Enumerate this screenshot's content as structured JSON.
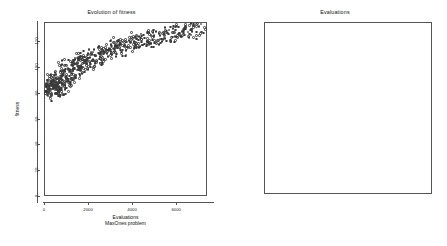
{
  "figure": {
    "background": "#ffffff",
    "panels": [
      "fitness-evolution",
      "evaluations-boxplot"
    ]
  },
  "left_panel": {
    "title": "Evolution of fitness",
    "xlabel_line1": "Evaluations",
    "xlabel_line2": "MaxOnes problem",
    "ylabel": "fitness"
  },
  "right_panel": {
    "title": "Evaluations",
    "xlabel_line1": "Population",
    "xlabel_line2": "MaxOnes",
    "ylabel": "evaluations"
  },
  "chart_data": [
    {
      "type": "scatter",
      "id": "fitness-evolution",
      "title": "Evolution of fitness",
      "xlabel": "Evaluations\nMaxOnes problem",
      "ylabel": "fitness",
      "xlim": [
        0,
        7400
      ],
      "ylim": [
        0,
        135
      ],
      "xticks": [
        0,
        2000,
        4000,
        6000
      ],
      "xticklabels": [
        "0",
        "2000",
        "4000",
        "6000"
      ],
      "yticks": [
        0,
        20,
        40,
        60,
        80,
        100,
        120
      ],
      "yticklabels": [
        "0",
        "20",
        "40",
        "60",
        "80",
        "100",
        "120"
      ],
      "grid": false,
      "legend": null,
      "marker": "open-circle",
      "marker_color": "#3a3a3a",
      "x": [
        320,
        340,
        360,
        380,
        400,
        420,
        440,
        460,
        480,
        500,
        520,
        540,
        560,
        580,
        600,
        620,
        640,
        660,
        680,
        700,
        720,
        740,
        760,
        790,
        820,
        850,
        880,
        910,
        940,
        970,
        1000,
        1040,
        1080,
        1120,
        1160,
        1200,
        1240,
        1280,
        1320,
        1360,
        1400,
        1450,
        1500,
        1550,
        1600,
        1650,
        1700,
        1760,
        1820,
        1880,
        1940,
        2000,
        2070,
        2140,
        2210,
        2280,
        2350,
        2420,
        2500,
        2580,
        2660,
        2740,
        2820,
        2900,
        2990,
        3080,
        3170,
        3260,
        3350,
        3440,
        3530,
        3630,
        3730,
        3830,
        3930,
        4030,
        4130,
        4240,
        4350,
        4460,
        4570,
        4680,
        4800,
        4920,
        5040,
        5160,
        5280,
        5400,
        5530,
        5660,
        5790,
        5920,
        6050,
        6180,
        6320,
        6460,
        6600,
        6740,
        6880,
        7020,
        7160,
        7280
      ],
      "y": [
        78,
        76,
        79,
        80,
        80,
        81,
        79,
        80,
        81,
        82,
        80,
        81,
        82,
        81,
        82,
        83,
        82,
        83,
        84,
        83,
        84,
        85,
        84,
        85,
        86,
        85,
        87,
        86,
        88,
        87,
        89,
        88,
        90,
        91,
        90,
        92,
        93,
        92,
        94,
        95,
        96,
        95,
        97,
        98,
        97,
        99,
        100,
        99,
        100,
        101,
        102,
        101,
        103,
        102,
        104,
        105,
        104,
        106,
        105,
        107,
        108,
        107,
        109,
        110,
        109,
        111,
        112,
        111,
        113,
        112,
        114,
        113,
        115,
        114,
        116,
        115,
        117,
        116,
        118,
        117,
        119,
        118,
        120,
        119,
        121,
        120,
        122,
        121,
        123,
        122,
        124,
        123,
        125,
        124,
        125,
        126,
        125,
        127,
        126,
        127,
        128,
        127,
        128,
        128
      ]
    },
    {
      "type": "box",
      "id": "evaluations-boxplot",
      "title": "Evaluations",
      "xlabel": "Population\nMaxOnes",
      "ylabel": "evaluations",
      "categories": [
        "32",
        "64",
        "128"
      ],
      "xticklabels": [
        "32",
        "64",
        "128"
      ],
      "yticks": [
        2000,
        4000,
        6000,
        8000,
        10000,
        12000,
        14000,
        16000
      ],
      "yticklabels": [
        "2000",
        "4000",
        "6000",
        "8000",
        "10000",
        "12000",
        "14000",
        "16000"
      ],
      "ylim": [
        1600,
        16400
      ],
      "grid": false,
      "legend": null,
      "boxes": [
        {
          "category": "32",
          "whisker_low": 2100,
          "q1": 2750,
          "median": 3050,
          "q3": 3400,
          "whisker_high": 4250,
          "outliers": [
            4700,
            4500
          ]
        },
        {
          "category": "64",
          "whisker_low": 3150,
          "q1": 4600,
          "median": 5250,
          "q3": 6150,
          "whisker_high": 7700,
          "outliers": [
            9500,
            8900,
            8600,
            8450,
            7900
          ]
        },
        {
          "category": "128",
          "whisker_low": 5200,
          "q1": 7450,
          "median": 8450,
          "q3": 9750,
          "whisker_high": 12250,
          "outliers": [
            15600,
            14300,
            12500
          ]
        }
      ]
    }
  ]
}
